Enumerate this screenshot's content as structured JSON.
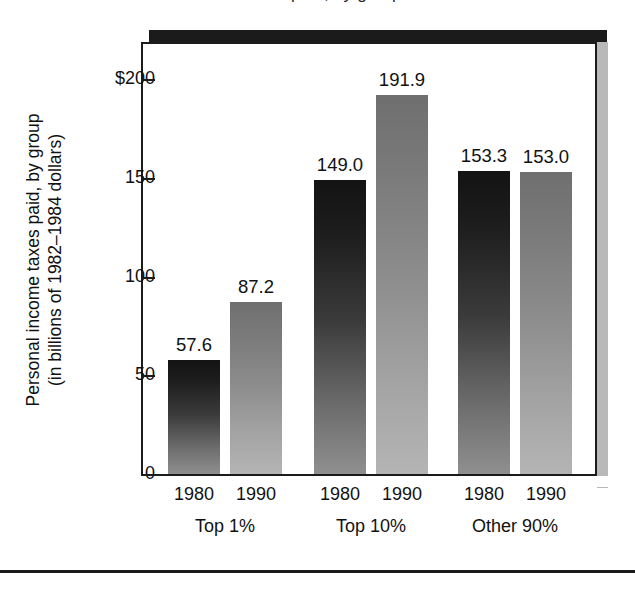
{
  "figure": {
    "top_clipped_caption": "Personal income taxes paid, by group",
    "axis_title_line1": "Personal income taxes paid, by group",
    "axis_title_line2": "(in billions of 1982–1984 dollars)"
  },
  "colors": {
    "frame": "#1b1b1b",
    "shadow": "#1b1b1b",
    "shadow_gray": "#b9b9b9",
    "bar_1980_dark_top": "#131313",
    "bar_1980_dark_bottom": "#8f8f8f",
    "bar_1990_light_top": "#6f6f6f",
    "bar_1990_light_bottom": "#b4b4b4",
    "text": "#111111",
    "background": "#ffffff"
  },
  "chart_data": {
    "type": "bar",
    "title": "Personal income taxes paid, by group",
    "xlabel": "",
    "ylabel": "Personal income taxes paid, by group (in billions of 1982–1984 dollars)",
    "ylim": [
      0,
      215
    ],
    "ytick_labels": [
      "$200",
      "150",
      "100",
      "50",
      "0"
    ],
    "ytick_values": [
      200,
      150,
      100,
      50,
      0
    ],
    "grid": false,
    "legend": "none",
    "categories": [
      "Top 1%",
      "Top 10%",
      "Other 90%"
    ],
    "series": [
      {
        "name": "1980",
        "values": [
          57.6,
          149.0,
          153.3
        ]
      },
      {
        "name": "1990",
        "values": [
          87.2,
          191.9,
          153.0
        ]
      }
    ],
    "bars": [
      {
        "group": "Top 1%",
        "year": "1980",
        "value": 57.6,
        "label": "57.6",
        "shade": "dark"
      },
      {
        "group": "Top 1%",
        "year": "1990",
        "value": 87.2,
        "label": "87.2",
        "shade": "light"
      },
      {
        "group": "Top 10%",
        "year": "1980",
        "value": 149.0,
        "label": "149.0",
        "shade": "dark"
      },
      {
        "group": "Top 10%",
        "year": "1990",
        "value": 191.9,
        "label": "191.9",
        "shade": "light"
      },
      {
        "group": "Other 90%",
        "year": "1980",
        "value": 153.3,
        "label": "153.3",
        "shade": "dark"
      },
      {
        "group": "Other 90%",
        "year": "1990",
        "value": 153.0,
        "label": "153.0",
        "shade": "light"
      }
    ]
  },
  "axis": {
    "ticks": [
      {
        "label": "$200",
        "value": 200
      },
      {
        "label": "150",
        "value": 150
      },
      {
        "label": "100",
        "value": 100
      },
      {
        "label": "50",
        "value": 50
      },
      {
        "label": "0",
        "value": 0
      }
    ]
  },
  "xaxis": {
    "years": [
      "1980",
      "1990",
      "1980",
      "1990",
      "1980",
      "1990"
    ],
    "groups": [
      "Top 1%",
      "Top 10%",
      "Other 90%"
    ]
  }
}
